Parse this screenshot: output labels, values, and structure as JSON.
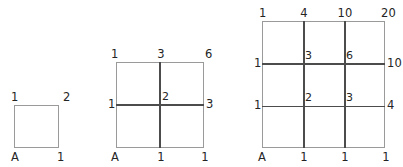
{
  "figure": {
    "colors": {
      "frame": "#9a9a9a",
      "interior_line": "#4c4c4c",
      "text": "#242424",
      "background": "#ffffff"
    },
    "diagrams": [
      {
        "id": "diagram-1",
        "subdivisions": 1,
        "origin_label": "A",
        "top_labels": [
          "1",
          "2"
        ],
        "bottom_labels": [
          "A",
          "1"
        ],
        "left_labels": [],
        "right_labels": [],
        "interior_labels": []
      },
      {
        "id": "diagram-2",
        "subdivisions": 2,
        "origin_label": "A",
        "top_labels": [
          "1",
          "3",
          "6"
        ],
        "bottom_labels": [
          "A",
          "1",
          "1"
        ],
        "left_labels": [
          "1"
        ],
        "right_labels": [
          "3"
        ],
        "interior_labels": [
          "2"
        ]
      },
      {
        "id": "diagram-3",
        "subdivisions": 3,
        "origin_label": "A",
        "top_labels": [
          "1",
          "4",
          "10",
          "20"
        ],
        "bottom_labels": [
          "A",
          "1",
          "1",
          "1"
        ],
        "left_labels": [
          "1",
          "1"
        ],
        "right_labels": [
          "10",
          "4"
        ],
        "interior_labels": [
          "3",
          "6",
          "2",
          "3"
        ]
      }
    ]
  }
}
